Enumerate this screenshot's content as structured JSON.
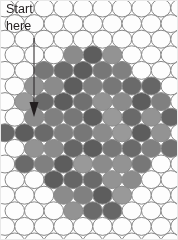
{
  "figure": {
    "name": "bubble-raft-lattice-diagram",
    "width": 178,
    "height": 240,
    "background_color": "#ffffff",
    "border_color": "#e8e8e8"
  },
  "annotation": {
    "label_text": "Start\nhere",
    "label_color": "#231f20",
    "label_font_size": 12.5,
    "arrow": {
      "name": "down-arrow",
      "color": "#231f20",
      "x": 34,
      "y_start": 38,
      "y_end": 116,
      "line_width": 1,
      "head_width": 9,
      "head_length": 14
    }
  },
  "lattice": {
    "type": "hexagonal-close-packed",
    "circle_diameter": 19.5,
    "row_spacing": 15.6,
    "col_spacing": 19.5,
    "row_offset": 9.75,
    "outline_color": "#8a8a8a",
    "outline_width": 1,
    "empty_fill": "#fdfdfd",
    "origin_x": 5,
    "origin_y": 8,
    "rows": 15,
    "cols": 10
  },
  "chart_data": {
    "type": "heatmap",
    "title": "",
    "xlabel": "",
    "ylabel": "",
    "shaded_colors": [
      "#777777",
      "#6a6a6a",
      "#8b8b8b",
      "#5d5d5d",
      "#939393",
      "#808080",
      "#666666",
      "#999999",
      "#707070",
      "#878787",
      "#5a5a5a",
      "#8f8f8f"
    ],
    "empty_color": "#fdfdfd",
    "grid": false,
    "legend": "none",
    "rows": [
      {
        "row": 0,
        "offset": false,
        "cells": [
          0,
          0,
          0,
          0,
          0,
          0,
          0,
          0,
          0,
          0
        ]
      },
      {
        "row": 1,
        "offset": true,
        "cells": [
          0,
          0,
          0,
          0,
          0,
          0,
          0,
          0,
          0,
          0
        ]
      },
      {
        "row": 2,
        "offset": false,
        "cells": [
          0,
          0,
          0,
          0,
          0,
          0,
          0,
          0,
          0,
          0
        ]
      },
      {
        "row": 3,
        "offset": true,
        "cells": [
          0,
          0,
          0,
          1,
          1,
          1,
          0,
          0,
          0,
          0
        ]
      },
      {
        "row": 4,
        "offset": false,
        "cells": [
          0,
          0,
          1,
          1,
          1,
          1,
          1,
          0,
          0,
          0
        ]
      },
      {
        "row": 5,
        "offset": true,
        "cells": [
          0,
          1,
          1,
          1,
          1,
          1,
          1,
          1,
          0,
          0
        ]
      },
      {
        "row": 6,
        "offset": false,
        "cells": [
          0,
          1,
          1,
          1,
          1,
          1,
          1,
          1,
          1,
          0
        ]
      },
      {
        "row": 7,
        "offset": true,
        "cells": [
          0,
          1,
          1,
          1,
          1,
          1,
          1,
          1,
          1,
          0
        ]
      },
      {
        "row": 8,
        "offset": false,
        "cells": [
          1,
          1,
          1,
          1,
          1,
          1,
          1,
          1,
          1,
          0
        ]
      },
      {
        "row": 9,
        "offset": true,
        "cells": [
          0,
          1,
          1,
          1,
          1,
          1,
          1,
          1,
          1,
          0
        ]
      },
      {
        "row": 10,
        "offset": false,
        "cells": [
          0,
          1,
          1,
          1,
          1,
          1,
          1,
          1,
          0,
          0
        ]
      },
      {
        "row": 11,
        "offset": true,
        "cells": [
          0,
          0,
          1,
          1,
          1,
          1,
          1,
          0,
          0,
          0
        ]
      },
      {
        "row": 12,
        "offset": false,
        "cells": [
          0,
          0,
          0,
          1,
          1,
          1,
          1,
          0,
          0,
          0
        ]
      },
      {
        "row": 13,
        "offset": true,
        "cells": [
          0,
          0,
          0,
          1,
          1,
          1,
          0,
          0,
          0,
          0
        ]
      },
      {
        "row": 14,
        "offset": false,
        "cells": [
          0,
          0,
          0,
          0,
          0,
          0,
          0,
          0,
          0,
          0
        ]
      },
      {
        "row": 15,
        "offset": true,
        "cells": [
          0,
          0,
          0,
          0,
          0,
          0,
          0,
          0,
          0,
          0
        ]
      }
    ],
    "shade_index": [
      [
        0,
        0,
        0,
        0,
        0,
        0,
        0,
        0,
        0,
        0
      ],
      [
        0,
        0,
        0,
        0,
        0,
        0,
        0,
        0,
        0,
        0
      ],
      [
        0,
        0,
        0,
        0,
        0,
        0,
        0,
        0,
        0,
        0
      ],
      [
        0,
        0,
        0,
        2,
        3,
        4,
        0,
        0,
        0,
        0
      ],
      [
        0,
        0,
        0,
        1,
        3,
        0,
        5,
        0,
        0,
        0
      ],
      [
        0,
        4,
        2,
        3,
        5,
        0,
        1,
        6,
        0,
        0
      ],
      [
        0,
        7,
        1,
        3,
        8,
        4,
        2,
        3,
        5,
        0
      ],
      [
        0,
        2,
        5,
        0,
        3,
        7,
        1,
        4,
        6,
        0
      ],
      [
        6,
        3,
        1,
        5,
        0,
        2,
        7,
        3,
        4,
        0
      ],
      [
        0,
        4,
        2,
        6,
        3,
        0,
        1,
        5,
        8,
        0
      ],
      [
        0,
        1,
        5,
        3,
        7,
        2,
        4,
        0,
        0,
        0
      ],
      [
        0,
        0,
        3,
        6,
        1,
        4,
        2,
        0,
        0,
        0
      ],
      [
        0,
        0,
        0,
        2,
        5,
        3,
        7,
        0,
        0,
        0
      ],
      [
        0,
        0,
        0,
        4,
        1,
        6,
        0,
        0,
        0,
        0
      ],
      [
        0,
        0,
        0,
        0,
        0,
        0,
        0,
        0,
        0,
        0
      ],
      [
        0,
        0,
        0,
        0,
        0,
        0,
        0,
        0,
        0,
        0
      ]
    ]
  }
}
